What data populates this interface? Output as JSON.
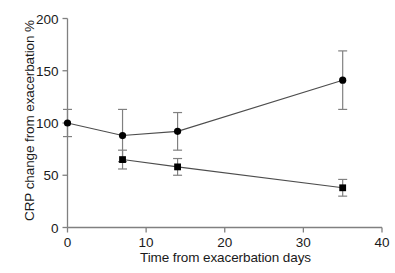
{
  "chart_data": {
    "type": "line",
    "title": "",
    "subtitle": "",
    "xlabel": "Time from exacerbation days",
    "ylabel": "CRP change from exacerbation %",
    "xlim": [
      0,
      40
    ],
    "ylim": [
      0,
      200
    ],
    "xticks": [
      0,
      10,
      20,
      30,
      40
    ],
    "xticklabels": [
      "0",
      "10",
      "20",
      "30",
      "40"
    ],
    "yticks": [
      0,
      50,
      100,
      150,
      200
    ],
    "yticklabels": [
      "0",
      "50",
      "100",
      "150",
      "200"
    ],
    "grid": false,
    "legend": "none",
    "error_bars": "symmetric",
    "series": [
      {
        "name": "circle-series",
        "marker": "circle",
        "x": [
          0,
          7,
          14,
          35
        ],
        "values": [
          100,
          88,
          92,
          141
        ],
        "errors": [
          13,
          25,
          18,
          28
        ]
      },
      {
        "name": "square-series",
        "marker": "square",
        "x": [
          7,
          14,
          35
        ],
        "values": [
          65,
          58,
          38
        ],
        "errors": [
          9,
          8,
          8
        ]
      }
    ],
    "colors": {
      "line": "#4d4d4d",
      "marker": "#000000",
      "errorbar": "#808080",
      "axis": "#808080",
      "text": "#1a1a1a",
      "background": "#ffffff"
    }
  }
}
